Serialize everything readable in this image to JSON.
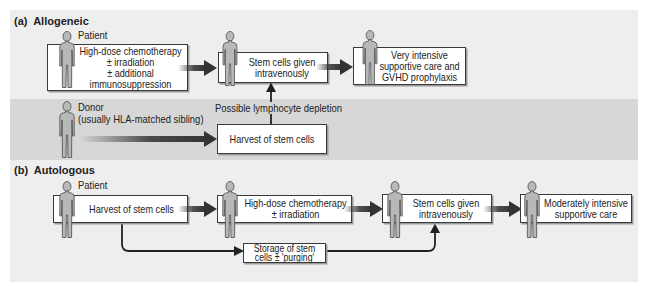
{
  "panel_a": {
    "label": "(a)  Allogeneic",
    "patient_label": "Patient",
    "donor_label": [
      "Donor",
      "(usually HLA-matched sibling)"
    ],
    "box_conditioning": [
      "High-dose chemotherapy",
      "± irradiation",
      "± additional",
      "immunosuppression"
    ],
    "box_infusion": [
      "Stem cells given",
      "intravenously"
    ],
    "box_supportive": [
      "Very intensive",
      "supportive care and",
      "GVHD prophylaxis"
    ],
    "lymphocyte_label": "Possible lymphocyte depletion",
    "box_harvest": [
      "Harvest of stem cells"
    ]
  },
  "panel_b": {
    "label": "(b)  Autologous",
    "patient_label": "Patient",
    "box_harvest": [
      "Harvest of stem cells"
    ],
    "box_conditioning": [
      "High-dose chemotherapy",
      "± irradiation"
    ],
    "box_infusion": [
      "Stem cells given",
      "intravenously"
    ],
    "box_supportive": [
      "Moderately intensive",
      "supportive care"
    ],
    "box_storage": [
      "Storage of stem",
      "cells ± 'purging'"
    ]
  },
  "colors": {
    "figure_background": "#eeeeee",
    "donor_band": "#d7d7d7",
    "arrow": "#333333",
    "person_fill": "#b8b8b8",
    "person_outline": "#4a4a4a"
  }
}
